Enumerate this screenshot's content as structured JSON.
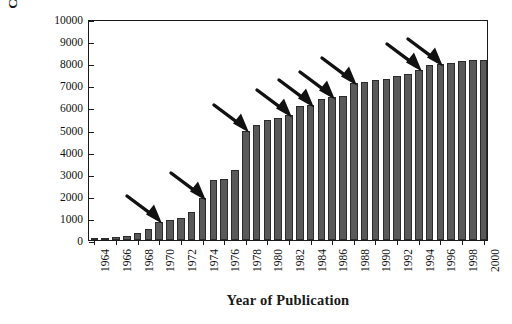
{
  "chart_data": {
    "type": "bar",
    "title": "",
    "xlabel": "Year of Publication",
    "ylabel": "Cumulative Citations",
    "ylim": [
      0,
      10000
    ],
    "ytick_step": 1000,
    "yticks": [
      0,
      1000,
      2000,
      3000,
      4000,
      5000,
      6000,
      7000,
      8000,
      9000,
      10000
    ],
    "ytick_labels": [
      "0",
      "1000",
      "2000",
      "3000",
      "4000",
      "5000",
      "6000",
      "7000",
      "8000",
      "9000",
      "10000"
    ],
    "grid": false,
    "legend": null,
    "bar_color": "#595959",
    "bar_edge_color": "#2b2b2b",
    "axis_color": "#1a1a1a",
    "categories": [
      "1964",
      "1965",
      "1966",
      "1967",
      "1968",
      "1969",
      "1970",
      "1971",
      "1972",
      "1973",
      "1974",
      "1975",
      "1976",
      "1977",
      "1978",
      "1979",
      "1980",
      "1981",
      "1982",
      "1983",
      "1984",
      "1985",
      "1986",
      "1987",
      "1988",
      "1989",
      "1990",
      "1991",
      "1992",
      "1993",
      "1994",
      "1995",
      "1996",
      "1997",
      "1998",
      "1999",
      "2000"
    ],
    "xtick_labels": [
      "1964",
      "1966",
      "1968",
      "1970",
      "1972",
      "1974",
      "1976",
      "1978",
      "1980",
      "1982",
      "1984",
      "1986",
      "1988",
      "1990",
      "1992",
      "1994",
      "1996",
      "1998",
      "2000"
    ],
    "values": [
      60,
      70,
      130,
      200,
      330,
      500,
      830,
      900,
      1000,
      1250,
      1900,
      2700,
      2750,
      3150,
      4950,
      5200,
      5450,
      5500,
      5650,
      6050,
      6100,
      6400,
      6450,
      6500,
      7100,
      7150,
      7250,
      7300,
      7400,
      7500,
      7700,
      7900,
      7950,
      8000,
      8100,
      8150,
      8150
    ],
    "annotations": [
      {
        "name": "arrow-1",
        "target_category": "1970",
        "target_value": 830
      },
      {
        "name": "arrow-2",
        "target_category": "1974",
        "target_value": 1900
      },
      {
        "name": "arrow-3",
        "target_category": "1978",
        "target_value": 4950
      },
      {
        "name": "arrow-4",
        "target_category": "1982",
        "target_value": 5650
      },
      {
        "name": "arrow-5",
        "target_category": "1984",
        "target_value": 6100
      },
      {
        "name": "arrow-6",
        "target_category": "1986",
        "target_value": 6450
      },
      {
        "name": "arrow-7",
        "target_category": "1988",
        "target_value": 7100
      },
      {
        "name": "arrow-8",
        "target_category": "1994",
        "target_value": 7700
      },
      {
        "name": "arrow-9",
        "target_category": "1996",
        "target_value": 7950
      }
    ]
  }
}
